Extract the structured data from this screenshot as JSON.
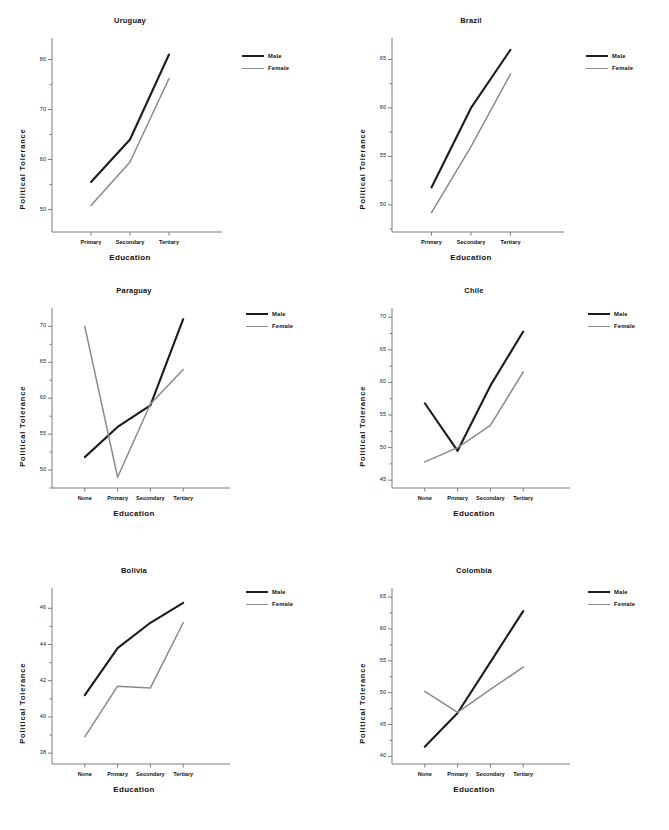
{
  "figure": {
    "series_names": [
      "Male",
      "Female"
    ],
    "colors": {
      "male": "#1c1c1c",
      "female": "#8a8a8a",
      "axis": "#7d7d7d",
      "text": "#111111"
    },
    "xlabel": "Education",
    "ylabel": "Political Tolerance"
  },
  "legend": {
    "male_label": "Male",
    "female_label": "Female"
  },
  "chart_data": [
    {
      "type": "line",
      "title": "Uruguay",
      "xlabel": "Education",
      "ylabel": "Political Tolerance",
      "categories": [
        "Primary",
        "Secondary",
        "Tertiary"
      ],
      "yticks": [
        50,
        60,
        70,
        80
      ],
      "ylim": [
        45.5,
        83.5
      ],
      "grid": false,
      "legend_position": "right",
      "series": [
        {
          "name": "Male",
          "values": [
            55.5,
            64.0,
            81.0
          ]
        },
        {
          "name": "Female",
          "values": [
            50.8,
            59.5,
            76.2
          ]
        }
      ]
    },
    {
      "type": "line",
      "title": "Brazil",
      "xlabel": "Education",
      "ylabel": "Political Tolerance",
      "categories": [
        "Primary",
        "Secondary",
        "Tertiary"
      ],
      "yticks": [
        50,
        55,
        60,
        65
      ],
      "ylim": [
        47.2,
        66.8
      ],
      "grid": false,
      "legend_position": "right",
      "series": [
        {
          "name": "Male",
          "values": [
            51.8,
            60.0,
            66.0
          ]
        },
        {
          "name": "Female",
          "values": [
            49.2,
            56.0,
            63.5
          ]
        }
      ]
    },
    {
      "type": "line",
      "title": "Paraguay",
      "xlabel": "Education",
      "ylabel": "Political Tolerance",
      "categories": [
        "None",
        "Primary",
        "Secondary",
        "Tertiary"
      ],
      "yticks": [
        50,
        55,
        60,
        65,
        70
      ],
      "ylim": [
        47.5,
        72.0
      ],
      "grid": false,
      "legend_position": "right",
      "series": [
        {
          "name": "Male",
          "values": [
            51.8,
            56.0,
            59.0,
            71.0
          ]
        },
        {
          "name": "Female",
          "values": [
            70.0,
            49.0,
            59.2,
            64.0
          ]
        }
      ]
    },
    {
      "type": "line",
      "title": "Chile",
      "xlabel": "Education",
      "ylabel": "Political Tolerance",
      "categories": [
        "None",
        "Primary",
        "Secondary",
        "Tertiary"
      ],
      "yticks": [
        45,
        50,
        55,
        60,
        65,
        70
      ],
      "ylim": [
        43.8,
        70.8
      ],
      "grid": false,
      "legend_position": "right",
      "series": [
        {
          "name": "Male",
          "values": [
            56.8,
            49.5,
            59.5,
            67.8
          ]
        },
        {
          "name": "Female",
          "values": [
            47.8,
            50.0,
            53.4,
            61.6
          ]
        }
      ]
    },
    {
      "type": "line",
      "title": "Bolivia",
      "xlabel": "Education",
      "ylabel": "Political Tolerance",
      "categories": [
        "None",
        "Primary",
        "Secondary",
        "Tertiary"
      ],
      "yticks": [
        38,
        40,
        42,
        44,
        46
      ],
      "ylim": [
        37.4,
        46.9
      ],
      "grid": false,
      "legend_position": "right",
      "series": [
        {
          "name": "Male",
          "values": [
            41.2,
            43.8,
            45.2,
            46.3
          ]
        },
        {
          "name": "Female",
          "values": [
            38.9,
            41.7,
            41.6,
            45.2
          ]
        }
      ]
    },
    {
      "type": "line",
      "title": "Colombia",
      "xlabel": "Education",
      "ylabel": "Political Tolerance",
      "categories": [
        "None",
        "Primary",
        "Secondary",
        "Tertiary"
      ],
      "yticks": [
        40,
        45,
        50,
        55,
        60,
        65
      ],
      "ylim": [
        38.8,
        65.8
      ],
      "grid": false,
      "legend_position": "right",
      "series": [
        {
          "name": "Male",
          "values": [
            41.5,
            46.8,
            54.8,
            62.8
          ]
        },
        {
          "name": "Female",
          "values": [
            50.2,
            46.9,
            50.5,
            54.0
          ]
        }
      ]
    }
  ]
}
